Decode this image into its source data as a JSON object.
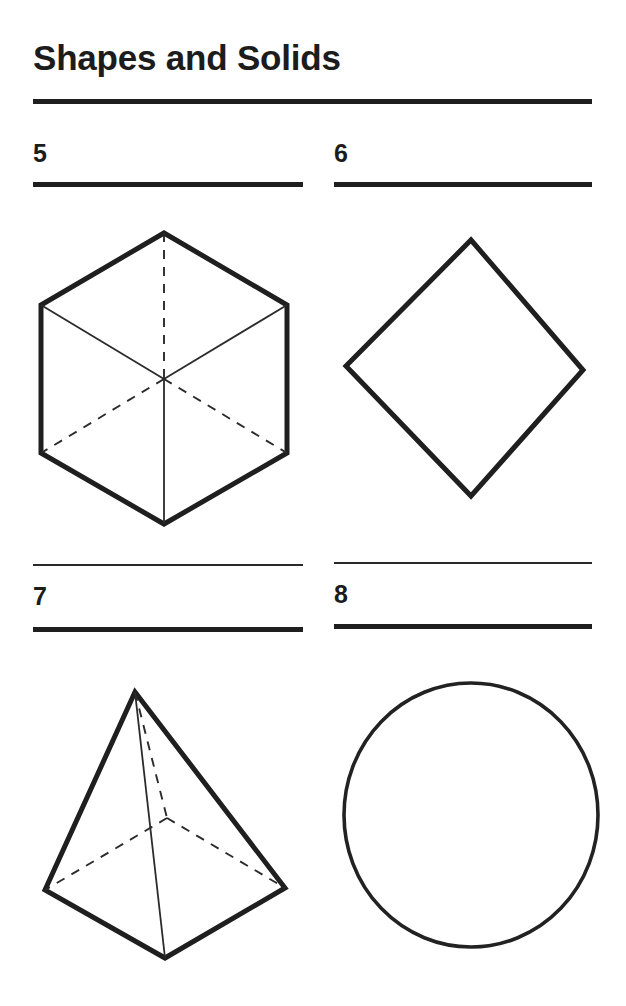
{
  "page": {
    "title": "Shapes and Solids",
    "background_color": "#ffffff",
    "ink_color": "#1f1f1f",
    "width": 626,
    "height": 1006
  },
  "rules": {
    "title_rule": "thick-horizontal-rule",
    "item_rule_thick": "thick-horizontal-rule",
    "item_rule_thin": "thin-horizontal-rule"
  },
  "items": [
    {
      "number": "5",
      "figure_name": "cube-wireframe",
      "figure_type": "cube",
      "description": "Cube drawn in isometric view as a hexagon outline with three solid visible interior edges and three dashed hidden interior edges meeting at the center"
    },
    {
      "number": "6",
      "figure_name": "square-diamond",
      "figure_type": "square",
      "description": "Square rotated 45 degrees, drawn as a diamond outline"
    },
    {
      "number": "7",
      "figure_name": "square-pyramid-wireframe",
      "figure_type": "pyramid",
      "description": "Square pyramid in perspective with solid visible edges and dashed hidden base and vertical edges"
    },
    {
      "number": "8",
      "figure_name": "circle-outline",
      "figure_type": "circle",
      "description": "Plain circle outline"
    }
  ]
}
